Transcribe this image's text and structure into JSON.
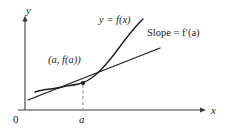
{
  "figure": {
    "name": "tangent-line-derivative-diagram",
    "background_color": "#ffffff",
    "ink_color": "#1a1a1a",
    "dashed_color": "#8c8c8c",
    "axes": {
      "y_axis_label": "y",
      "x_axis_label": "x",
      "origin_label": "0",
      "x_tick_label": "a"
    },
    "annotations": {
      "curve_label": "y = f(x)",
      "slope_label": "Slope = f′(a)",
      "point_label": "(a, f(a))"
    }
  },
  "chart_data": {
    "type": "line",
    "title": "",
    "xlabel": "x",
    "ylabel": "y",
    "grid": false,
    "legend": "none",
    "annotations": [
      {
        "text": "y = f(x)",
        "target": "curve",
        "x": 105,
        "y": 20
      },
      {
        "text": "Slope = f′(a)",
        "target": "tangent-line",
        "x": 160,
        "y": 33
      },
      {
        "text": "(a, f(a))",
        "target": "tangent-point",
        "x": 60,
        "y": 60
      },
      {
        "text": "a",
        "target": "x-axis-tick",
        "x": 83,
        "y": 120
      },
      {
        "text": "0",
        "target": "origin",
        "x": 16,
        "y": 119
      }
    ],
    "series": [
      {
        "name": "y = f(x)",
        "type": "curve",
        "style": "solid",
        "points": [
          [
            35,
            92
          ],
          [
            42,
            90
          ],
          [
            50,
            89
          ],
          [
            58,
            88
          ],
          [
            66,
            86
          ],
          [
            74,
            85
          ],
          [
            83,
            83
          ],
          [
            92,
            78
          ],
          [
            100,
            71
          ],
          [
            108,
            62
          ],
          [
            116,
            52
          ],
          [
            124,
            41
          ],
          [
            132,
            31
          ],
          [
            138,
            24
          ],
          [
            143,
            19
          ]
        ]
      },
      {
        "name": "Slope = f′(a)",
        "type": "tangent",
        "style": "solid",
        "points": [
          [
            28,
            100
          ],
          [
            83,
            83
          ],
          [
            160,
            48
          ]
        ]
      },
      {
        "name": "dashed drop line at x = a",
        "type": "dashed-vertical",
        "style": "dashed",
        "points": [
          [
            83,
            83
          ],
          [
            83,
            110
          ]
        ]
      }
    ],
    "markers": [
      {
        "name": "tangent-point",
        "x": 83,
        "y": 83,
        "shape": "dot",
        "label": "(a, f(a))"
      }
    ],
    "axis_geometry": {
      "y_axis": {
        "x": 25,
        "y_top": 18,
        "y_bottom": 110,
        "arrow": "up"
      },
      "x_axis": {
        "y": 110,
        "x_left": 18,
        "x_right": 205,
        "arrow": "right"
      }
    }
  }
}
